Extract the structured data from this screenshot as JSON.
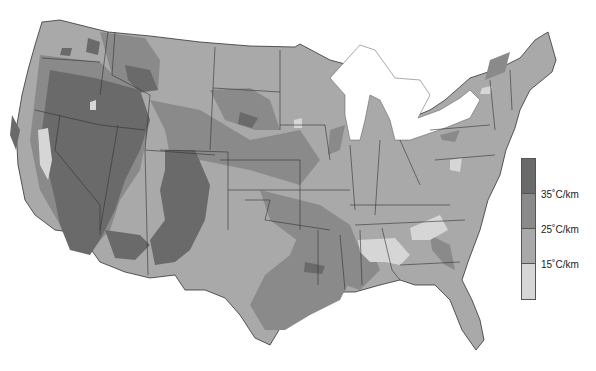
{
  "map": {
    "subject": "Geothermal gradient, contiguous United States",
    "background": "#ffffff",
    "border_color": "#333333",
    "lake_color": "#ffffff",
    "classes": [
      {
        "id": "c4",
        "range": "> 35°C/km",
        "color": "#6a6a6a"
      },
      {
        "id": "c3",
        "range": "25–35°C/km",
        "color": "#8a8a8a"
      },
      {
        "id": "c2",
        "range": "15–25°C/km",
        "color": "#a9a9a9"
      },
      {
        "id": "c1",
        "range": "< 15°C/km",
        "color": "#d6d6d6"
      }
    ],
    "regions": [
      {
        "name": "Great Basin / Nevada / Oregon",
        "class": "c4"
      },
      {
        "name": "Arizona / New Mexico",
        "class": "c4"
      },
      {
        "name": "Colorado Rockies",
        "class": "c4"
      },
      {
        "name": "Idaho / Montana Rockies",
        "class": "c3"
      },
      {
        "name": "Wyoming / Nebraska band",
        "class": "c3"
      },
      {
        "name": "Texas Gulf Coast",
        "class": "c3"
      },
      {
        "name": "Louisiana / Mississippi",
        "class": "c3"
      },
      {
        "name": "Great Plains",
        "class": "c2"
      },
      {
        "name": "Midwest / East",
        "class": "c2"
      },
      {
        "name": "Southeast (Alabama / Georgia)",
        "class": "c1"
      },
      {
        "name": "Central Valley California",
        "class": "c1"
      }
    ]
  },
  "legend": {
    "colors": [
      "#6a6a6a",
      "#8a8a8a",
      "#a9a9a9",
      "#d6d6d6"
    ],
    "labels": [
      "35˚C/km",
      "25˚C/km",
      "15˚C/km"
    ]
  }
}
